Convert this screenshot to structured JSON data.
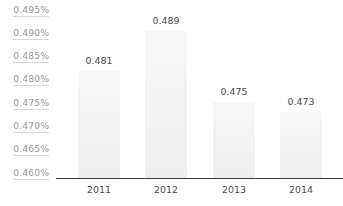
{
  "chart_data": {
    "type": "bar",
    "title": "",
    "subtitle": "",
    "xlabel": "",
    "ylabel": "",
    "categories": [
      "2011",
      "2012",
      "2013",
      "2014"
    ],
    "values": [
      0.481,
      0.489,
      0.475,
      0.473
    ],
    "value_labels": [
      "0.481",
      "0.489",
      "0.475",
      "0.473"
    ],
    "ylim": [
      0.46,
      0.495
    ],
    "ytick_values": [
      0.495,
      0.49,
      0.485,
      0.48,
      0.475,
      0.47,
      0.465,
      0.46
    ],
    "ytick_labels": [
      "0.495%",
      "0.490%",
      "0.485%",
      "0.480%",
      "0.475%",
      "0.470%",
      "0.465%",
      "0.460%"
    ],
    "grid": false,
    "legend": false,
    "legend_position": "none",
    "colors": {
      "bar_fill_top": "#f7f7f7",
      "bar_fill_bottom": "#efefef",
      "axis_line": "#3a3a3a",
      "value_label_text": "#4a4a4a",
      "tick_label_text": "#9a9a9a",
      "tick_underline": "#d8d8d8",
      "background": "#ffffff"
    }
  }
}
